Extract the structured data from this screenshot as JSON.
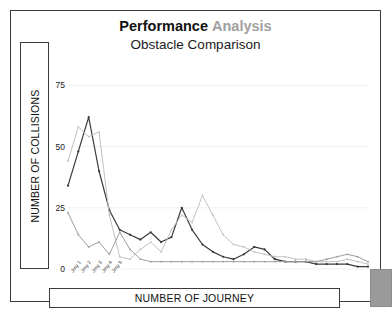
{
  "title": {
    "primary": "Performance",
    "secondary": "Analysis",
    "subtitle": "Obstacle Comparison"
  },
  "axes": {
    "ylabel": "NUMBER OF COLLISIONS",
    "xlabel": "NUMBER OF JOURNEY"
  },
  "chart_data": {
    "type": "line",
    "title": "Performance Analysis",
    "subtitle": "Obstacle Comparison",
    "xlabel": "NUMBER OF JOURNEY",
    "ylabel": "NUMBER OF COLLISIONS",
    "ylim": [
      0,
      80
    ],
    "yticks": [
      0,
      25,
      50,
      75
    ],
    "ytick_labels": [
      "0",
      "25",
      "50",
      "75"
    ],
    "grid": true,
    "grid_axis": "y",
    "legend": "none",
    "categories": [
      "Jrny 1",
      "Jrny 2",
      "Jrny 3",
      "Jrny 4",
      "Jrny 5",
      "Jrny 6",
      "Jrny 7",
      "Jrny 8",
      "Jrny 9",
      "Jrny 10",
      "Jrny 11",
      "Jrny 12",
      "Jrny 13",
      "Jrny 14",
      "Jrny 15",
      "Jrny 16",
      "Jrny 17",
      "Jrny 18",
      "Jrny 19",
      "Jrny 20",
      "Jrny 21",
      "Jrny 22",
      "Jrny 23",
      "Jrny 24",
      "Jrny 25",
      "Jrny 26",
      "Jrny 27",
      "Jrny 28",
      "Jrny 29",
      "Jrny 30"
    ],
    "series": [
      {
        "name": "Series 1",
        "color": "#3a3a3a",
        "values": [
          34,
          48,
          62,
          40,
          24,
          16,
          14,
          12,
          15,
          11,
          13,
          25,
          16,
          10,
          7,
          5,
          4,
          6,
          9,
          8,
          4,
          3,
          3,
          3,
          2,
          2,
          2,
          2,
          1,
          1
        ]
      },
      {
        "name": "Series 2",
        "color": "#c2c2c2",
        "values": [
          44,
          58,
          54,
          56,
          22,
          5,
          4,
          8,
          11,
          7,
          16,
          22,
          19,
          30,
          22,
          14,
          10,
          9,
          7,
          6,
          5,
          5,
          4,
          4,
          3,
          3,
          3,
          4,
          3,
          2
        ]
      },
      {
        "name": "Series 3",
        "color": "#9e9e9e",
        "values": [
          23,
          14,
          9,
          11,
          6,
          15,
          8,
          4,
          3,
          3,
          3,
          3,
          3,
          3,
          3,
          3,
          3,
          3,
          3,
          3,
          3,
          3,
          3,
          3,
          3,
          4,
          5,
          6,
          5,
          3
        ]
      }
    ]
  }
}
